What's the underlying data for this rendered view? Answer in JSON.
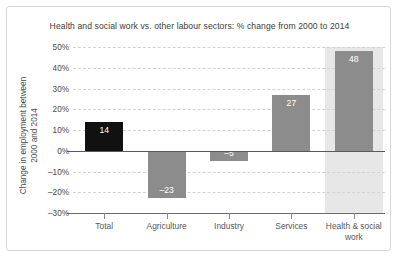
{
  "chart_data": {
    "type": "bar",
    "title": "Health and social work vs. other labour sectors: % change from 2000 to 2014",
    "xlabel": "",
    "ylabel": "Change in employment between 2000 and 2014",
    "ylabel_line1": "Change in employment between",
    "ylabel_line2": "2000 and 2014",
    "categories": [
      "Total",
      "Agriculture",
      "Industry",
      "Services",
      "Health & social work"
    ],
    "category_lines": [
      [
        "Total"
      ],
      [
        "Agriculture"
      ],
      [
        "Industry"
      ],
      [
        "Services"
      ],
      [
        "Health & social",
        "work"
      ]
    ],
    "values": [
      14,
      -23,
      -5,
      27,
      48
    ],
    "value_labels": [
      "14",
      "–23",
      "–5",
      "27",
      "48"
    ],
    "bar_colors": [
      "#111111",
      "#8c8c8c",
      "#8c8c8c",
      "#8c8c8c",
      "#8c8c8c"
    ],
    "highlighted_category": "Health & social work",
    "highlight_color": "#e7e7e7",
    "ylim": [
      -30,
      50
    ],
    "ytick_values": [
      50,
      40,
      30,
      20,
      10,
      0,
      -10,
      -20,
      -30
    ],
    "ytick_labels": [
      "50%",
      "40%",
      "30%",
      "20%",
      "10%",
      "0%",
      "–10%",
      "–20%",
      "–30%"
    ],
    "grid": true,
    "grid_style": "dashed",
    "grid_color": "#d2d2d2",
    "legend": null,
    "zero_line": 0,
    "units": "percent"
  }
}
